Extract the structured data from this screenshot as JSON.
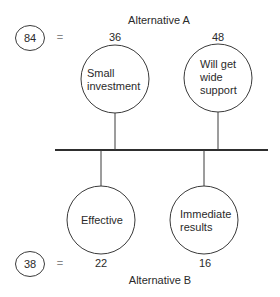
{
  "alternative_a": {
    "title": "Alternative A",
    "total_score": "84",
    "equals": "=",
    "factors": [
      {
        "label": "Small\ninvestment",
        "score": "36"
      },
      {
        "label": "Will get\nwide\nsupport",
        "score": "48"
      }
    ]
  },
  "alternative_b": {
    "title": "Alternative B",
    "total_score": "38",
    "equals": "=",
    "factors": [
      {
        "label": "Effective",
        "score": "22"
      },
      {
        "label": "Immediate\nresults",
        "score": "16"
      }
    ]
  },
  "colors": {
    "stroke": "#3a3a3a",
    "text": "#2a2a2a",
    "background": "#ffffff"
  }
}
